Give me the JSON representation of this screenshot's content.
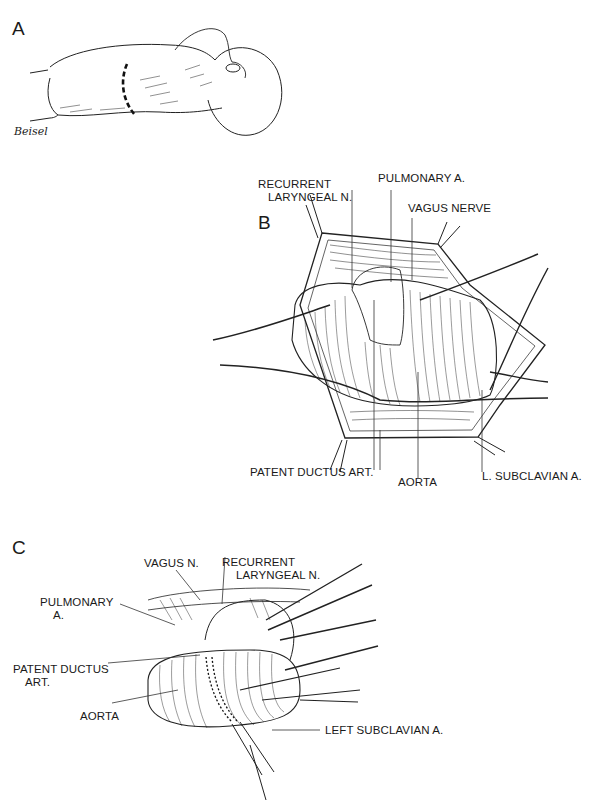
{
  "figure": {
    "panels": [
      {
        "id": "A",
        "letter": "A",
        "signature": "Beisel"
      },
      {
        "id": "B",
        "letter": "B",
        "labels": {
          "recurrent_laryngeal_1": "RECURRENT",
          "recurrent_laryngeal_2": "LARYNGEAL N.",
          "pulmonary": "PULMONARY A.",
          "vagus": "VAGUS NERVE",
          "patent_ductus": "PATENT DUCTUS ART.",
          "aorta": "AORTA",
          "subclavian": "L. SUBCLAVIAN A."
        }
      },
      {
        "id": "C",
        "letter": "C",
        "labels": {
          "recurrent_laryngeal_1": "RECURRENT",
          "recurrent_laryngeal_2": "LARYNGEAL N.",
          "vagus": "VAGUS N.",
          "pulmonary_1": "PULMONARY",
          "pulmonary_2": "A.",
          "patent_ductus_1": "PATENT DUCTUS",
          "patent_ductus_2": "ART.",
          "aorta": "AORTA",
          "subclavian": "LEFT SUBCLAVIAN A."
        }
      }
    ]
  }
}
